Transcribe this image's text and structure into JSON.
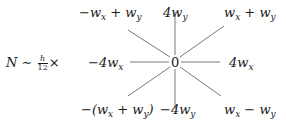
{
  "prefix": {
    "lhs": "N",
    "relation": "∼",
    "frac_num": "h",
    "frac_den": "12",
    "times": "×"
  },
  "stencil": {
    "center": "0",
    "top_left": {
      "pre": "−w",
      "sub1": "x",
      "mid": " + w",
      "sub2": "y",
      "post": ""
    },
    "top": {
      "pre": "4w",
      "sub1": "y"
    },
    "top_right": {
      "pre": "w",
      "sub1": "x",
      "mid": " + w",
      "sub2": "y",
      "post": ""
    },
    "left": {
      "pre": "−4w",
      "sub1": "x"
    },
    "right": {
      "pre": "4w",
      "sub1": "x"
    },
    "bottom_left": {
      "pre": "−(w",
      "sub1": "x",
      "mid": " + w",
      "sub2": "y",
      "post": ")"
    },
    "bottom": {
      "pre": "−4w",
      "sub1": "y"
    },
    "bottom_right": {
      "pre": "w",
      "sub1": "x",
      "mid": " − w",
      "sub2": "y",
      "post": ""
    }
  },
  "colors": {
    "line": "#555555",
    "text": "#1a1a1a"
  }
}
